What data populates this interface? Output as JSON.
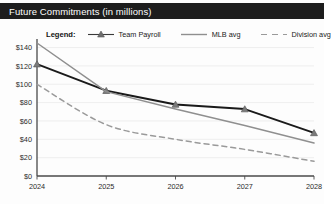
{
  "window": {
    "title": "Future Commitments (in millions)"
  },
  "legend": {
    "label": "Legend:",
    "position": "top",
    "items": [
      {
        "name": "Team Payroll",
        "marker": "triangle-marker-icon",
        "style": "solid-dark",
        "color": "#1a1a1a"
      },
      {
        "name": "MLB avg",
        "marker": "line-swatch-icon",
        "style": "solid-grey",
        "color": "#8f8f8f"
      },
      {
        "name": "Division avg",
        "marker": "dashed-swatch-icon",
        "style": "dashed-grey",
        "color": "#9a9a9a"
      }
    ]
  },
  "chart_data": {
    "type": "line",
    "title": "Future Commitments (in millions)",
    "xlabel": "",
    "ylabel": "",
    "x": [
      "2024",
      "2025",
      "2026",
      "2027",
      "2028"
    ],
    "categories": [
      "2024",
      "2025",
      "2026",
      "2027",
      "2028"
    ],
    "ylim": [
      0,
      145
    ],
    "yticks": [
      0,
      20,
      40,
      60,
      80,
      100,
      120,
      140
    ],
    "ytick_labels": [
      "$0",
      "$20",
      "$40",
      "$60",
      "$80",
      "$100",
      "$120",
      "$140"
    ],
    "xtick_labels": [
      "2024",
      "2025",
      "2026",
      "2027",
      "2028"
    ],
    "grid": true,
    "grid_axis": "y",
    "legend_position": "top",
    "series": [
      {
        "name": "Team Payroll",
        "color": "#1a1a1a",
        "style": "solid",
        "marker": "triangle",
        "values": [
          122,
          93,
          78,
          73,
          47
        ]
      },
      {
        "name": "MLB avg",
        "color": "#8f8f8f",
        "style": "solid",
        "marker": "none",
        "values": [
          145,
          92,
          73,
          55,
          36
        ]
      },
      {
        "name": "Division avg",
        "color": "#9a9a9a",
        "style": "dashed",
        "marker": "none",
        "values": [
          100,
          56,
          40,
          29,
          16
        ]
      }
    ]
  },
  "axes": {
    "y_ticks": [
      "$140",
      "$120",
      "$100",
      "$80",
      "$60",
      "$40",
      "$20",
      "$0"
    ],
    "x_ticks": [
      "2024",
      "2025",
      "2026",
      "2027",
      "2028"
    ]
  },
  "colors": {
    "title_bar": "#1d1d1d",
    "title_text": "#ffffff",
    "plot_bg": "#fdfdfd",
    "grid": "#ececec",
    "axis": "#4a4a4a"
  }
}
